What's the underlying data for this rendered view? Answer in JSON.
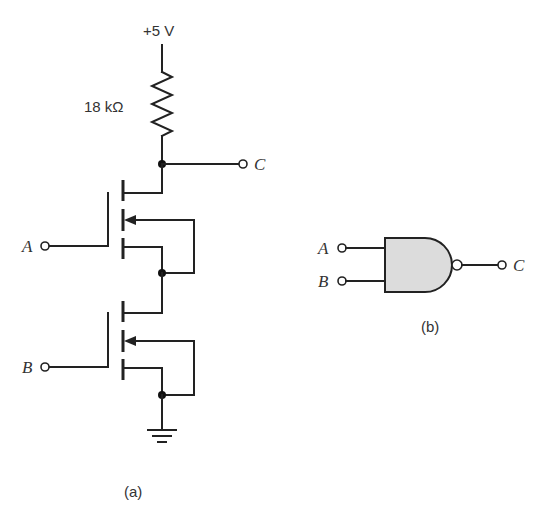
{
  "figure": {
    "part_a": {
      "caption": "(a)",
      "supply_label": "+5 V",
      "resistor_label": "18 kΩ",
      "input_a_label": "A",
      "input_b_label": "B",
      "output_label": "C",
      "components": [
        "resistor",
        "nmos-transistor-top",
        "nmos-transistor-bottom",
        "ground"
      ]
    },
    "part_b": {
      "caption": "(b)",
      "gate_type": "NAND",
      "input_a_label": "A",
      "input_b_label": "B",
      "output_label": "C",
      "gate_fill": "#dcdcdc"
    }
  }
}
